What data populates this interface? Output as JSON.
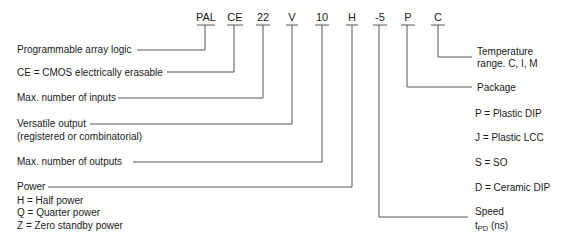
{
  "diagram": {
    "code_segments": [
      {
        "code": "PAL",
        "meaning": "Programmable array logic"
      },
      {
        "code": "CE",
        "meaning": "CE = CMOS electrically erasable"
      },
      {
        "code": "22",
        "meaning": "Max. number of inputs"
      },
      {
        "code": "V",
        "meaning": "Versatile output",
        "meaning_line2": "(registered or combinatorial)"
      },
      {
        "code": "10",
        "meaning": "Max. number of outputs"
      },
      {
        "code": "H",
        "meaning": "Power",
        "options": [
          "H = Half power",
          "Q = Quarter power",
          "Z = Zero standby power"
        ]
      },
      {
        "code": "-5",
        "meaning": "Speed",
        "meaning_line2_prefix": "t",
        "meaning_line2_sub": "PD",
        "meaning_line2_suffix": " (ns)"
      },
      {
        "code": "P",
        "meaning": "Package",
        "options": [
          "P = Plastic DIP",
          "J = Plastic LCC",
          "S = SO",
          "D = Ceramic DIP"
        ]
      },
      {
        "code": "C",
        "meaning": "Temperature",
        "meaning_line2": "range. C, I, M"
      }
    ]
  }
}
